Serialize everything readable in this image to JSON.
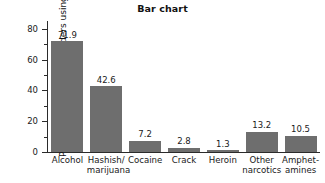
{
  "chart_data": {
    "type": "bar",
    "title": "Bar chart",
    "xlabel": "",
    "ylabel": "Percentage of twelfth graders using",
    "categories": [
      "Alcohol",
      "Hashish/ marijuana",
      "Cocaine",
      "Crack",
      "Heroin",
      "Other narcotics",
      "Amphet- amines"
    ],
    "category_lines": [
      [
        "Alcohol",
        ""
      ],
      [
        "Hashish/",
        "marijuana"
      ],
      [
        "Cocaine",
        ""
      ],
      [
        "Crack",
        ""
      ],
      [
        "Heroin",
        ""
      ],
      [
        "Other",
        "narcotics"
      ],
      [
        "Amphet-",
        "amines"
      ]
    ],
    "values": [
      71.9,
      42.6,
      7.2,
      2.8,
      1.3,
      13.2,
      10.5
    ],
    "value_labels": [
      "71.9",
      "42.6",
      "7.2",
      "2.8",
      "1.3",
      "13.2",
      "10.5"
    ],
    "ylim": [
      0,
      85
    ],
    "yticks": [
      0,
      20,
      40,
      60,
      80
    ],
    "ytick_labels": [
      "0",
      "20",
      "40",
      "60",
      "80"
    ],
    "yminor_ticks": [
      10,
      30,
      50,
      70
    ],
    "grid": false,
    "legend": null,
    "bar_color": "#6e6e6e",
    "axis_color": "#2b2b2b",
    "background": "#ffffff"
  }
}
